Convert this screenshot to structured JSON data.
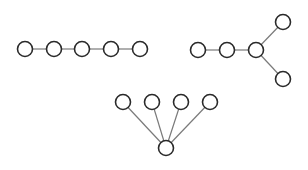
{
  "diagram": {
    "title": "",
    "width": 308,
    "height": 170,
    "colors": {
      "background": "#ffffff",
      "node_stroke": "#2a2a2a",
      "node_fill": "#ffffff",
      "edge_stroke": "#7a7a7a"
    },
    "node_radius": 7.5,
    "graphs": [
      {
        "name": "path-graph",
        "description": "Path of 5 nodes",
        "nodes": [
          {
            "id": "p1",
            "x": 25,
            "y": 49
          },
          {
            "id": "p2",
            "x": 54,
            "y": 49
          },
          {
            "id": "p3",
            "x": 82,
            "y": 49
          },
          {
            "id": "p4",
            "x": 111,
            "y": 49
          },
          {
            "id": "p5",
            "x": 140,
            "y": 49
          }
        ],
        "edges": [
          [
            "p1",
            "p2"
          ],
          [
            "p2",
            "p3"
          ],
          [
            "p3",
            "p4"
          ],
          [
            "p4",
            "p5"
          ]
        ]
      },
      {
        "name": "fork-graph",
        "description": "Path of 3 nodes ending in a fork with 2 branches",
        "nodes": [
          {
            "id": "f1",
            "x": 198,
            "y": 50
          },
          {
            "id": "f2",
            "x": 227,
            "y": 50
          },
          {
            "id": "f3",
            "x": 256,
            "y": 50
          },
          {
            "id": "f4",
            "x": 283,
            "y": 22
          },
          {
            "id": "f5",
            "x": 283,
            "y": 79
          }
        ],
        "edges": [
          [
            "f1",
            "f2"
          ],
          [
            "f2",
            "f3"
          ],
          [
            "f3",
            "f4"
          ],
          [
            "f3",
            "f5"
          ]
        ]
      },
      {
        "name": "star-graph",
        "description": "Star with 4 leaves above a central hub",
        "nodes": [
          {
            "id": "s1",
            "x": 123,
            "y": 102
          },
          {
            "id": "s2",
            "x": 152,
            "y": 102
          },
          {
            "id": "s3",
            "x": 181,
            "y": 102
          },
          {
            "id": "s4",
            "x": 210,
            "y": 102
          },
          {
            "id": "hub",
            "x": 166,
            "y": 148
          }
        ],
        "edges": [
          [
            "s1",
            "hub"
          ],
          [
            "s2",
            "hub"
          ],
          [
            "s3",
            "hub"
          ],
          [
            "s4",
            "hub"
          ]
        ]
      }
    ]
  }
}
